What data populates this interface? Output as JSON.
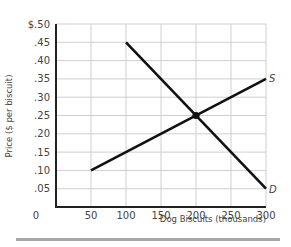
{
  "chart_data": {
    "type": "line",
    "title": "",
    "xlabel": "Dog Biscuits (thousands)",
    "ylabel": "Price ($ per biscuit)",
    "xlim": [
      0,
      300
    ],
    "ylim": [
      0,
      0.5
    ],
    "grid": true,
    "x_ticks": [
      "0",
      "50",
      "100",
      "150",
      "200",
      "250",
      "300"
    ],
    "y_ticks": [
      "$.50",
      ".45",
      ".40",
      ".35",
      ".30",
      ".25",
      ".20",
      ".15",
      ".10",
      ".05"
    ],
    "series": [
      {
        "name": "S",
        "label": "S",
        "points": [
          [
            50,
            0.1
          ],
          [
            300,
            0.35
          ]
        ]
      },
      {
        "name": "D",
        "label": "D",
        "points": [
          [
            100,
            0.45
          ],
          [
            300,
            0.05
          ]
        ]
      }
    ],
    "annotations": [
      {
        "type": "point",
        "label": "equilibrium",
        "x": 200,
        "y": 0.25
      }
    ]
  },
  "colors": {
    "line": "#111111",
    "grid": "#cfcfcf",
    "axis": "#222222",
    "rule": "#a8a8a8"
  }
}
